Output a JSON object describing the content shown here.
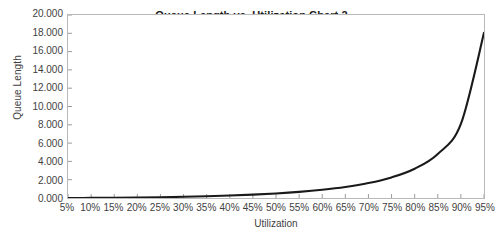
{
  "chart_data": {
    "type": "line",
    "title": "Queue Length vs. Utilization Chart 2",
    "xlabel": "Utilization",
    "ylabel": "Queue Length",
    "xlim": [
      5,
      95
    ],
    "ylim": [
      0,
      20
    ],
    "grid": false,
    "legend": "none",
    "line_color": "#1a1a1a",
    "frame_color": "#b9b9b9",
    "x_tick_labels": [
      "5%",
      "10%",
      "15%",
      "20%",
      "25%",
      "30%",
      "35%",
      "40%",
      "45%",
      "50%",
      "55%",
      "60%",
      "65%",
      "70%",
      "75%",
      "80%",
      "85%",
      "90%",
      "95%"
    ],
    "y_tick_labels": [
      "0.000",
      "2.000",
      "4.000",
      "6.000",
      "8.000",
      "10.000",
      "12.000",
      "14.000",
      "16.000",
      "18.000",
      "20.000"
    ],
    "y_tick_values": [
      0,
      2,
      4,
      6,
      8,
      10,
      12,
      14,
      16,
      18,
      20
    ],
    "x": [
      5,
      10,
      15,
      20,
      25,
      30,
      35,
      40,
      45,
      50,
      55,
      60,
      65,
      70,
      75,
      80,
      85,
      90,
      95
    ],
    "series": [
      {
        "name": "Queue Length",
        "values": [
          0.003,
          0.011,
          0.026,
          0.05,
          0.083,
          0.129,
          0.188,
          0.267,
          0.368,
          0.5,
          0.672,
          0.9,
          1.207,
          1.633,
          2.25,
          3.2,
          4.817,
          8.1,
          18.05
        ]
      }
    ]
  }
}
